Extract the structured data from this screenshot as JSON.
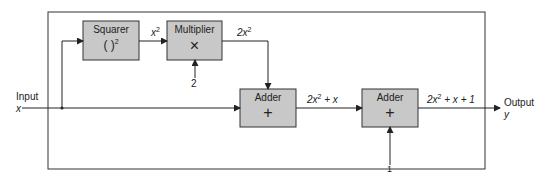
{
  "blocks": {
    "squarer": {
      "title": "Squarer",
      "symbol": "( )",
      "sup": "2"
    },
    "multiplier": {
      "title": "Multiplier",
      "symbol": "×"
    },
    "adder1": {
      "title": "Adder",
      "symbol": "+"
    },
    "adder2": {
      "title": "Adder",
      "symbol": "+"
    }
  },
  "signals": {
    "input_label": "Input",
    "input_var": "x",
    "x2_base": "x",
    "x2_sup": "2",
    "const2": "2",
    "m_out_coef": "2x",
    "m_out_sup": "2",
    "a1_out_pre": "2x",
    "a1_out_sup": "2",
    "a1_out_post": " + x",
    "const1": "1",
    "a2_out_pre": "2x",
    "a2_out_sup": "2",
    "a2_out_post": " + x + 1",
    "output_label": "Output",
    "output_var": "y"
  },
  "colors": {
    "block_fill": "#c8c8c8",
    "line": "#222222"
  }
}
